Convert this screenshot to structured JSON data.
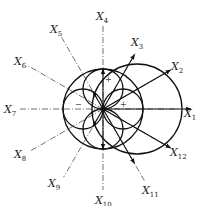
{
  "diagram": {
    "center": {
      "x": 103,
      "y": 109
    },
    "axes": [
      {
        "id": "X1",
        "letter": "X",
        "sub": "1",
        "angle": 0,
        "solid_len": 88,
        "label": {
          "x": 184,
          "y": 117
        }
      },
      {
        "id": "X2",
        "letter": "X",
        "sub": "2",
        "angle": 30,
        "solid_len": 78,
        "label": {
          "x": 171,
          "y": 70
        }
      },
      {
        "id": "X3",
        "letter": "X",
        "sub": "3",
        "angle": 60,
        "solid_len": 63,
        "label": {
          "x": 131,
          "y": 46
        }
      },
      {
        "id": "X4",
        "letter": "X",
        "sub": "4",
        "angle": 90,
        "solid_len": 40,
        "label": {
          "x": 96,
          "y": 20
        }
      },
      {
        "id": "X5",
        "letter": "X",
        "sub": "5",
        "angle": 120,
        "solid_len": 20,
        "label": {
          "x": 50,
          "y": 33
        }
      },
      {
        "id": "X6",
        "letter": "X",
        "sub": "6",
        "angle": 150,
        "solid_len": 0,
        "label": {
          "x": 14,
          "y": 65
        }
      },
      {
        "id": "X7",
        "letter": "X",
        "sub": "7",
        "angle": 180,
        "solid_len": 0,
        "label": {
          "x": 4,
          "y": 113
        }
      },
      {
        "id": "X8",
        "letter": "X",
        "sub": "8",
        "angle": 210,
        "solid_len": 0,
        "label": {
          "x": 14,
          "y": 158
        }
      },
      {
        "id": "X9",
        "letter": "X",
        "sub": "9",
        "angle": 240,
        "solid_len": 20,
        "label": {
          "x": 48,
          "y": 187
        }
      },
      {
        "id": "X10",
        "letter": "X",
        "sub": "10",
        "angle": 270,
        "solid_len": 40,
        "label": {
          "x": 95,
          "y": 204
        }
      },
      {
        "id": "X11",
        "letter": "X",
        "sub": "11",
        "angle": 300,
        "solid_len": 63,
        "label": {
          "x": 142,
          "y": 194
        }
      },
      {
        "id": "X12",
        "letter": "X",
        "sub": "12",
        "angle": 330,
        "solid_len": 78,
        "label": {
          "x": 170,
          "y": 156
        }
      }
    ],
    "circles": [
      {
        "name": "large-offset-circle",
        "cx": 137,
        "cy": 109,
        "r": 45
      },
      {
        "name": "centered-circle",
        "cx": 103,
        "cy": 109,
        "r": 40
      },
      {
        "name": "right-lobe",
        "cx": 123,
        "cy": 109,
        "r": 20
      },
      {
        "name": "left-lobe",
        "cx": 83,
        "cy": 109,
        "r": 20
      },
      {
        "name": "top-lobe",
        "cx": 103,
        "cy": 89,
        "r": 20
      },
      {
        "name": "bottom-lobe",
        "cx": 103,
        "cy": 129,
        "r": 20
      }
    ],
    "signs": [
      {
        "text": "+",
        "x": 120,
        "y": 107
      },
      {
        "text": "−",
        "x": 75,
        "y": 107
      },
      {
        "text": "+",
        "x": 105,
        "y": 82
      }
    ]
  }
}
